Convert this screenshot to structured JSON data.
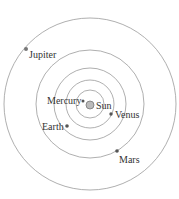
{
  "diagram": {
    "title": "",
    "center": {
      "x": 90,
      "y": 104
    },
    "orbits": [
      {
        "name": "mercury-orbit",
        "r": 14
      },
      {
        "name": "venus-orbit",
        "r": 24
      },
      {
        "name": "earth-orbit",
        "r": 36
      },
      {
        "name": "mars-orbit",
        "r": 54
      },
      {
        "name": "jupiter-orbit",
        "r": 86
      }
    ],
    "bodies": {
      "sun": {
        "label": "Sun"
      },
      "mercury": {
        "label": "Mercury"
      },
      "venus": {
        "label": "Venus"
      },
      "earth": {
        "label": "Earth"
      },
      "mars": {
        "label": "Mars"
      },
      "jupiter": {
        "label": "Jupiter"
      }
    },
    "colors": {
      "orbit": "#9a9a9a",
      "planet": "#555555",
      "sun_fill": "#bbbbbb",
      "text": "#333333"
    }
  }
}
